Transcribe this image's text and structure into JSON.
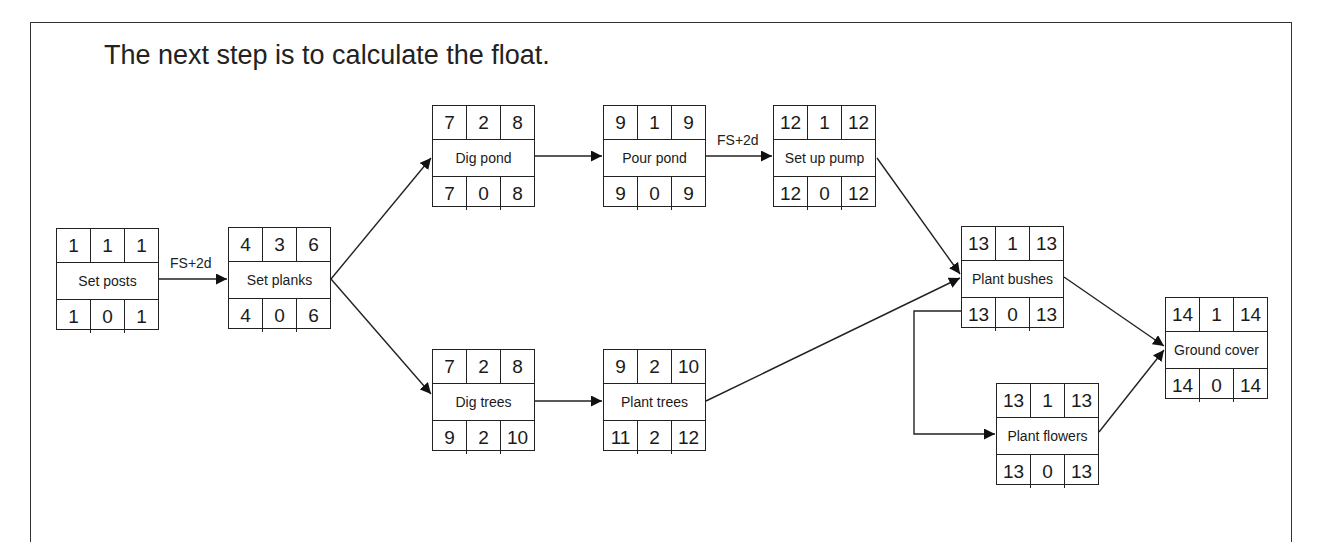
{
  "heading": "The next step is to calculate the float.",
  "nodes": {
    "set_posts": {
      "name": "Set posts",
      "es": "1",
      "dur": "1",
      "ef": "1",
      "ls": "1",
      "float": "0",
      "lf": "1"
    },
    "set_planks": {
      "name": "Set planks",
      "es": "4",
      "dur": "3",
      "ef": "6",
      "ls": "4",
      "float": "0",
      "lf": "6"
    },
    "dig_pond": {
      "name": "Dig pond",
      "es": "7",
      "dur": "2",
      "ef": "8",
      "ls": "7",
      "float": "0",
      "lf": "8"
    },
    "pour_pond": {
      "name": "Pour pond",
      "es": "9",
      "dur": "1",
      "ef": "9",
      "ls": "9",
      "float": "0",
      "lf": "9"
    },
    "set_up_pump": {
      "name": "Set up pump",
      "es": "12",
      "dur": "1",
      "ef": "12",
      "ls": "12",
      "float": "0",
      "lf": "12"
    },
    "dig_trees": {
      "name": "Dig trees",
      "es": "7",
      "dur": "2",
      "ef": "8",
      "ls": "9",
      "float": "2",
      "lf": "10"
    },
    "plant_trees": {
      "name": "Plant trees",
      "es": "9",
      "dur": "2",
      "ef": "10",
      "ls": "11",
      "float": "2",
      "lf": "12"
    },
    "plant_bushes": {
      "name": "Plant bushes",
      "es": "13",
      "dur": "1",
      "ef": "13",
      "ls": "13",
      "float": "0",
      "lf": "13"
    },
    "plant_flowers": {
      "name": "Plant flowers",
      "es": "13",
      "dur": "1",
      "ef": "13",
      "ls": "13",
      "float": "0",
      "lf": "13"
    },
    "ground_cover": {
      "name": "Ground cover",
      "es": "14",
      "dur": "1",
      "ef": "14",
      "ls": "14",
      "float": "0",
      "lf": "14"
    }
  },
  "lags": {
    "set_posts_to_set_planks": "FS+2d",
    "pour_pond_to_set_up_pump": "FS+2d"
  },
  "edges": [
    {
      "from": "Set posts",
      "to": "Set planks",
      "label": "FS+2d"
    },
    {
      "from": "Set planks",
      "to": "Dig pond"
    },
    {
      "from": "Set planks",
      "to": "Dig trees"
    },
    {
      "from": "Dig pond",
      "to": "Pour pond"
    },
    {
      "from": "Pour pond",
      "to": "Set up pump",
      "label": "FS+2d"
    },
    {
      "from": "Dig trees",
      "to": "Plant trees"
    },
    {
      "from": "Set up pump",
      "to": "Plant bushes"
    },
    {
      "from": "Plant trees",
      "to": "Plant bushes"
    },
    {
      "from": "Plant bushes",
      "to": "Plant flowers"
    },
    {
      "from": "Plant bushes",
      "to": "Ground cover"
    },
    {
      "from": "Plant flowers",
      "to": "Ground cover"
    }
  ]
}
